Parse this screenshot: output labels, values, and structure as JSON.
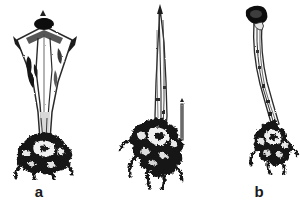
{
  "figure": {
    "domain_type": "scientific-line-drawing",
    "background_color": "#ffffff",
    "ink_color": "#1a1a1a",
    "width_px": 300,
    "height_px": 212,
    "panel_count": 3,
    "caption_visible": false
  },
  "panels": [
    {
      "id": "a",
      "label": "a",
      "label_x": 38,
      "label_y": 191,
      "description": "funnel-shaped specimen with dark apical knob, flared winged cup, tapering stalk and dark branched holdfast at base",
      "art": {
        "apex_x": 44,
        "apex_y": 22,
        "base_x": 44,
        "base_y": 162,
        "max_width": 58,
        "shape": "funnel"
      }
    },
    {
      "id": "b",
      "label": "b",
      "label_x": 150,
      "label_y": 191,
      "description": "long slender tapering spike with spreading dark clumped root mass at base and a small detached stem fragment to its right",
      "art": {
        "apex_x": 160,
        "apex_y": 10,
        "base_x": 155,
        "base_y": 180,
        "max_width": 48,
        "shape": "spike"
      }
    },
    {
      "id": "c",
      "label": "c",
      "label_x": 268,
      "label_y": 191,
      "description": "slender curved stalk with dark rounded hooked knob at the apex and a compact dark root mass at the base",
      "art": {
        "apex_x": 258,
        "apex_y": 18,
        "base_x": 272,
        "base_y": 150,
        "max_width": 40,
        "shape": "curved-stalk"
      }
    }
  ]
}
